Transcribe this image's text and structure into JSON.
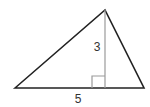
{
  "diagram": {
    "type": "triangle",
    "vertices": {
      "left": [
        15,
        88
      ],
      "apex": [
        105,
        10
      ],
      "right": [
        144,
        88
      ]
    },
    "altitude": {
      "from": [
        105,
        10
      ],
      "to": [
        105,
        88
      ]
    },
    "right_angle_marker": {
      "x": 92,
      "y": 76,
      "size": 13
    },
    "labels": {
      "base": "5",
      "height": "3"
    },
    "colors": {
      "edge": "#222222",
      "altitude": "#9a9a9a",
      "label": "#333333"
    }
  }
}
